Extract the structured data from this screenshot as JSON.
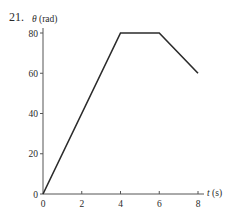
{
  "problem_number": "21.",
  "colors": {
    "axis": "#555555",
    "curve": "#2b2b2b",
    "text": "#2a2a2a"
  },
  "chart_data": {
    "type": "line",
    "title": "",
    "xlabel": "t (s)",
    "ylabel": "θ (rad)",
    "xlim": [
      0,
      8
    ],
    "ylim": [
      0,
      80
    ],
    "x_ticks": [
      0,
      2,
      4,
      6,
      8
    ],
    "y_ticks": [
      0,
      20,
      40,
      60,
      80
    ],
    "grid": false,
    "legend": null,
    "series": [
      {
        "name": "θ(t)",
        "x": [
          0,
          4,
          6,
          8
        ],
        "y": [
          0,
          80,
          80,
          60
        ]
      }
    ]
  }
}
